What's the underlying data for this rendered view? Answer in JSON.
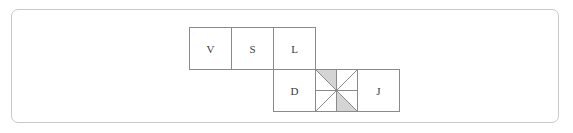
{
  "figure": {
    "cell_size": 42,
    "colors": {
      "frame_border": "#c9c9c9",
      "cell_stroke": "#8a8a8a",
      "cell_fill": "#ffffff",
      "shade_fill": "#d4d4d4",
      "label_color": "#3a3a3a",
      "background": "#ffffff"
    },
    "top_row": [
      {
        "label": "V",
        "col": 0
      },
      {
        "label": "S",
        "col": 1
      },
      {
        "label": "L",
        "col": 2
      }
    ],
    "bottom_row": [
      {
        "label": "D",
        "col": 2
      },
      {
        "label": "",
        "col": 3,
        "kind": "pinwheel"
      },
      {
        "label": "J",
        "col": 4
      }
    ],
    "pinwheel": {
      "quadrants": [
        {
          "position": "top-left",
          "upper_triangle": "shaded",
          "lower_triangle": "blank"
        },
        {
          "position": "top-right",
          "upper_triangle": "blank",
          "lower_triangle": "blank"
        },
        {
          "position": "bottom-right",
          "upper_triangle": "blank",
          "lower_triangle": "shaded"
        },
        {
          "position": "bottom-left",
          "upper_triangle": "blank",
          "lower_triangle": "blank"
        }
      ]
    }
  }
}
